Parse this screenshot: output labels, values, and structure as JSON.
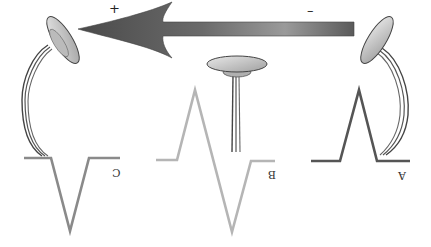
{
  "diagram": {
    "type": "ECG electrode orientation (mirrored)",
    "arrow": {
      "direction": "right-to-left",
      "positive_label": "+",
      "negative_label": "–",
      "color_head": "#555555",
      "color_tail": "#7a7a7a"
    },
    "electrodes": [
      {
        "id": "C",
        "label": "C",
        "position": "left",
        "orientation": "tilted toward arrow head"
      },
      {
        "id": "B",
        "label": "B",
        "position": "center",
        "orientation": "perpendicular (top)"
      },
      {
        "id": "A",
        "label": "A",
        "position": "right",
        "orientation": "tilted toward arrow tail"
      }
    ],
    "waveforms": [
      {
        "id": "C",
        "label": "C",
        "deflection": "negative",
        "color": "#8a8a8a"
      },
      {
        "id": "B",
        "label": "B",
        "deflection": "biphasic",
        "color": "#b5b5b5"
      },
      {
        "id": "A",
        "label": "A",
        "deflection": "positive",
        "color": "#555555"
      }
    ]
  }
}
